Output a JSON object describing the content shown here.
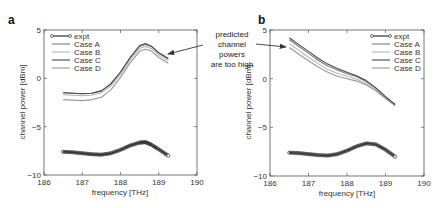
{
  "annotation": {
    "lines": [
      "predicted",
      "channel",
      "powers",
      "are too high"
    ]
  },
  "chart_data": [
    {
      "panel_label": "a",
      "type": "line",
      "title": "",
      "xlabel": "frequency [THz]",
      "ylabel": "channel power [dBm]",
      "xlim": [
        186,
        190
      ],
      "ylim": [
        -10,
        5
      ],
      "xticks": [
        186,
        187,
        188,
        189,
        190
      ],
      "yticks": [
        -10,
        -5,
        0,
        5
      ],
      "xtick_labels": [
        "186",
        "187",
        "188",
        "189",
        "190"
      ],
      "ytick_labels": [
        "−10",
        "−5",
        "0",
        "5"
      ],
      "legend_position": "upper left",
      "grid": false,
      "x": [
        186.5,
        186.75,
        187.0,
        187.25,
        187.5,
        187.75,
        188.0,
        188.25,
        188.5,
        188.65,
        188.8,
        189.0,
        189.25
      ],
      "series": [
        {
          "name": "expt",
          "color": "#333333",
          "marker": "o",
          "values": [
            -7.6,
            -7.65,
            -7.75,
            -7.85,
            -7.9,
            -7.75,
            -7.4,
            -6.95,
            -6.65,
            -6.6,
            -6.85,
            -7.35,
            -8.0
          ]
        },
        {
          "name": "Case A",
          "color": "#7a7a7a",
          "values": [
            -1.5,
            -1.55,
            -1.6,
            -1.55,
            -1.3,
            -0.6,
            0.6,
            2.1,
            3.3,
            3.5,
            3.3,
            2.6,
            2.0
          ]
        },
        {
          "name": "Case B",
          "color": "#b5b5b5",
          "values": [
            -1.7,
            -1.75,
            -1.8,
            -1.75,
            -1.5,
            -0.8,
            0.4,
            1.9,
            3.1,
            3.3,
            3.1,
            2.4,
            1.8
          ]
        },
        {
          "name": "Case C",
          "color": "#4a4a4a",
          "values": [
            -1.5,
            -1.55,
            -1.6,
            -1.55,
            -1.3,
            -0.55,
            0.65,
            2.15,
            3.4,
            3.6,
            3.35,
            2.65,
            2.05
          ]
        },
        {
          "name": "Case D",
          "color": "#999999",
          "values": [
            -2.2,
            -2.25,
            -2.3,
            -2.2,
            -1.95,
            -1.2,
            0.1,
            1.6,
            2.8,
            3.0,
            2.85,
            2.15,
            1.55
          ]
        }
      ]
    },
    {
      "panel_label": "b",
      "type": "line",
      "title": "",
      "xlabel": "frequency [THz]",
      "ylabel": "channel power [dBm]",
      "xlim": [
        186,
        190
      ],
      "ylim": [
        -10,
        5
      ],
      "xticks": [
        186,
        187,
        188,
        189,
        190
      ],
      "yticks": [
        -10,
        -5,
        0,
        5
      ],
      "xtick_labels": [
        "186",
        "187",
        "188",
        "189",
        "190"
      ],
      "ytick_labels": [
        "−10",
        "−5",
        "0",
        "5"
      ],
      "legend_position": "upper right",
      "grid": false,
      "x": [
        186.5,
        186.75,
        187.0,
        187.25,
        187.5,
        187.75,
        188.0,
        188.25,
        188.5,
        188.75,
        189.0,
        189.25
      ],
      "series": [
        {
          "name": "expt",
          "color": "#333333",
          "marker": "o",
          "values": [
            -7.6,
            -7.65,
            -7.75,
            -7.85,
            -7.9,
            -7.75,
            -7.4,
            -6.95,
            -6.65,
            -6.75,
            -7.3,
            -8.0
          ]
        },
        {
          "name": "Case A",
          "color": "#7a7a7a",
          "values": [
            4.0,
            3.3,
            2.6,
            1.9,
            1.3,
            0.9,
            0.5,
            0.2,
            -0.3,
            -1.0,
            -1.9,
            -2.7
          ]
        },
        {
          "name": "Case B",
          "color": "#b5b5b5",
          "values": [
            3.6,
            2.9,
            2.2,
            1.55,
            0.95,
            0.55,
            0.25,
            -0.05,
            -0.5,
            -1.15,
            -2.0,
            -2.75
          ]
        },
        {
          "name": "Case C",
          "color": "#4a4a4a",
          "values": [
            4.2,
            3.5,
            2.8,
            2.1,
            1.5,
            1.05,
            0.65,
            0.3,
            -0.2,
            -0.95,
            -1.85,
            -2.65
          ]
        },
        {
          "name": "Case D",
          "color": "#999999",
          "values": [
            3.2,
            2.5,
            1.85,
            1.2,
            0.65,
            0.25,
            0.0,
            -0.25,
            -0.65,
            -1.25,
            -2.05,
            -2.8
          ]
        }
      ]
    }
  ]
}
